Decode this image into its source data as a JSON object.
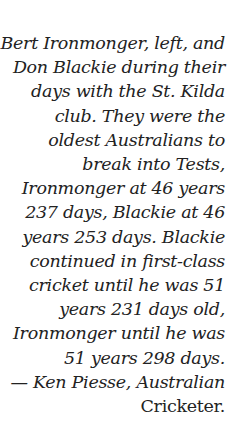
{
  "caption": {
    "lines": [
      "Bert Ironmonger, left, and",
      "Don Blackie during their",
      "days with the St. Kilda",
      "club. They were the",
      "oldest Australians to",
      "break into Tests,",
      "Ironmonger at 46 years",
      "237 days, Blackie at 46",
      "years 253 days. Blackie",
      "continued in first-class",
      "cricket until he was 51",
      "years 231 days old,",
      "Ironmonger until he was",
      "51 years 298 days.",
      "— Ken Piesse, Australian",
      "Cricketer."
    ]
  }
}
